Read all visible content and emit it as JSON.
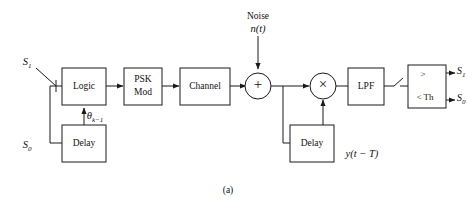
{
  "figure": {
    "caption": "(a)",
    "inputs": {
      "s1_label": "S",
      "s1_sub": "1",
      "s0_label": "S",
      "s0_sub": "0"
    },
    "noise": {
      "title": "Noise",
      "expr_head": "n",
      "expr_tail": "(t)"
    },
    "blocks": [
      {
        "id": "logic",
        "label": "Logic"
      },
      {
        "id": "psk-mod",
        "label_line1": "PSK",
        "label_line2": "Mod"
      },
      {
        "id": "channel",
        "label": "Channel"
      },
      {
        "id": "lpf",
        "label": "LPF"
      },
      {
        "id": "delay-tx",
        "label": "Delay"
      },
      {
        "id": "delay-rx",
        "label": "Delay"
      }
    ],
    "operators": {
      "summer": "+",
      "multiplier": "×"
    },
    "feedback": {
      "theta_symbol": "θ",
      "theta_sub": "k−1"
    },
    "delayed_signal": {
      "head": "y",
      "tail": "(t − T)"
    },
    "threshold": {
      "top_label": ">",
      "bottom_label": "< Th"
    },
    "outputs": {
      "out1_label": "S",
      "out1_sub": "1",
      "out0_label": "S",
      "out0_sub": "0"
    }
  }
}
